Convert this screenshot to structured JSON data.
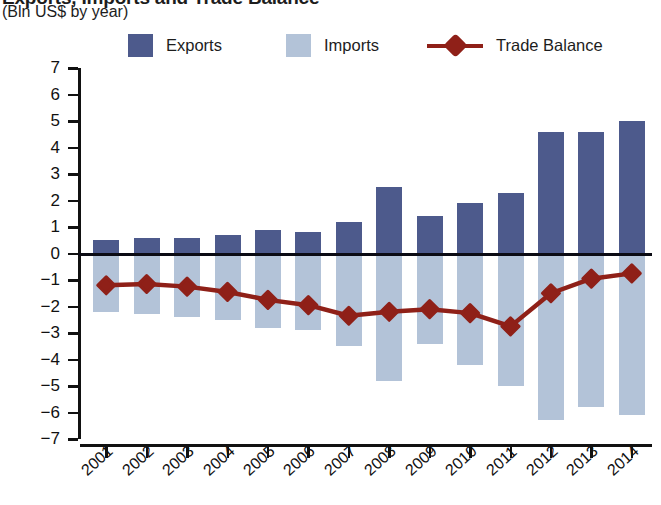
{
  "title": {
    "main": "Exports, Imports and Trade Balance",
    "units": "(Bln US$ by year)"
  },
  "legend": {
    "items": [
      {
        "label": "Exports",
        "color": "#4d5a8c",
        "marker": "square-swatch"
      },
      {
        "label": "Imports",
        "color": "#b3c3d8",
        "marker": "square-swatch"
      },
      {
        "label": "Trade Balance",
        "color": "#8f2018",
        "marker": "line-with-diamond"
      }
    ]
  },
  "chart_data": {
    "type": "bar",
    "title": "Exports, Imports and Trade Balance",
    "subtitle": "(Bln US$ by year)",
    "xlabel": "",
    "ylabel": "(Bln US$ by year)",
    "ylim": [
      -7,
      7
    ],
    "ytick_step": 1,
    "yticks": [
      "7",
      "6",
      "5",
      "4",
      "3",
      "2",
      "1",
      "0",
      "−1",
      "−2",
      "−3",
      "−4",
      "−5",
      "−6",
      "−7"
    ],
    "grid": false,
    "legend_position": "top",
    "categories": [
      "2001",
      "2002",
      "2003",
      "2004",
      "2005",
      "2006",
      "2007",
      "2008",
      "2009",
      "2010",
      "2011",
      "2012",
      "2013",
      "2014"
    ],
    "series": [
      {
        "name": "Exports",
        "type": "bar",
        "color": "#4d5a8c",
        "values": [
          0.5,
          0.6,
          0.6,
          0.7,
          0.9,
          0.8,
          1.2,
          2.5,
          1.4,
          1.9,
          2.3,
          4.6,
          4.6,
          5.0
        ]
      },
      {
        "name": "Imports",
        "type": "bar",
        "color": "#b3c3d8",
        "values": [
          -2.2,
          -2.3,
          -2.4,
          -2.5,
          -2.8,
          -2.9,
          -3.5,
          -4.8,
          -3.4,
          -4.2,
          -5.0,
          -6.3,
          -5.8,
          -6.1
        ]
      },
      {
        "name": "Trade Balance",
        "type": "line",
        "color": "#8f2018",
        "values": [
          -1.2,
          -1.15,
          -1.25,
          -1.45,
          -1.75,
          -1.95,
          -2.35,
          -2.2,
          -2.1,
          -2.25,
          -2.75,
          -1.5,
          -0.95,
          -0.75
        ]
      }
    ]
  }
}
